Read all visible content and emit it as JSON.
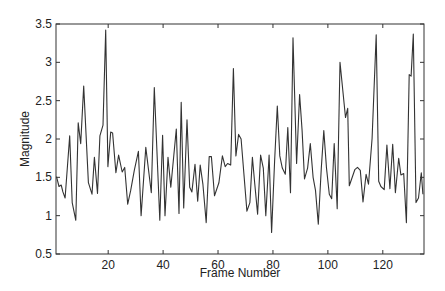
{
  "chart_data": {
    "type": "line",
    "title": "",
    "xlabel": "Frame Number",
    "ylabel": "Magnitude",
    "xlim": [
      1,
      135
    ],
    "ylim": [
      0.5,
      3.5
    ],
    "grid": false,
    "legend": null,
    "xticks": [
      20,
      40,
      60,
      80,
      100,
      120
    ],
    "yticks": [
      0.5,
      1,
      1.5,
      2,
      2.5,
      3,
      3.5
    ],
    "xtick_labels": [
      "20",
      "40",
      "60",
      "80",
      "100",
      "120"
    ],
    "ytick_labels": [
      "0.5",
      "1",
      "1.5",
      "2",
      "2.5",
      "3",
      "3.5"
    ],
    "line_color": "#333333",
    "series": [
      {
        "name": "Magnitude",
        "x": [
          1.2,
          2.1,
          2.9,
          3.5,
          4.3,
          6.0,
          6.9,
          8.2,
          9.1,
          10.0,
          11.1,
          12.8,
          14.1,
          15.0,
          16.1,
          17.0,
          18.1,
          19.1,
          19.9,
          20.9,
          21.6,
          22.8,
          23.8,
          25.1,
          26.0,
          27.1,
          28.2,
          29.5,
          31.0,
          32.0,
          33.7,
          35.7,
          36.8,
          38.8,
          39.8,
          40.7,
          41.8,
          42.8,
          44.8,
          45.8,
          46.6,
          47.5,
          48.7,
          49.7,
          50.5,
          51.6,
          52.6,
          53.5,
          54.5,
          55.7,
          56.8,
          57.6,
          58.7,
          60.3,
          61.6,
          62.6,
          63.5,
          64.6,
          65.6,
          66.5,
          67.5,
          68.4,
          70.5,
          71.6,
          72.5,
          73.4,
          74.4,
          75.5,
          76.5,
          77.4,
          78.6,
          79.5,
          80.6,
          81.6,
          82.5,
          83.4,
          84.5,
          85.4,
          86.4,
          87.3,
          88.6,
          89.7,
          90.6,
          91.5,
          92.6,
          93.6,
          94.6,
          95.5,
          96.5,
          97.6,
          98.5,
          99.5,
          100.5,
          101.4,
          102.3,
          103.4,
          104.4,
          106.4,
          107.2,
          107.8,
          109.8,
          110.8,
          111.8,
          112.8,
          113.9,
          114.8,
          116.1,
          117.6,
          118.5,
          119.3,
          120.5,
          121.5,
          122.6,
          123.6,
          124.6,
          125.8,
          126.6,
          127.6,
          128.6,
          129.6,
          130.3,
          131.1,
          132.1,
          133.0,
          134.0,
          134.6
        ],
        "y": [
          1.51,
          1.38,
          1.4,
          1.31,
          1.23,
          2.04,
          1.17,
          0.94,
          2.21,
          1.94,
          2.69,
          1.43,
          1.28,
          1.76,
          1.29,
          2.04,
          2.18,
          3.42,
          1.64,
          2.09,
          2.08,
          1.56,
          1.79,
          1.57,
          1.63,
          1.15,
          1.33,
          1.59,
          1.84,
          1.0,
          1.89,
          1.3,
          2.67,
          0.94,
          2.05,
          1.0,
          1.76,
          1.37,
          2.13,
          1.03,
          2.48,
          1.1,
          2.25,
          1.37,
          1.31,
          1.67,
          1.19,
          1.66,
          1.41,
          0.91,
          1.77,
          1.77,
          1.26,
          1.43,
          1.78,
          1.64,
          1.68,
          1.66,
          2.92,
          1.78,
          2.06,
          2.0,
          1.06,
          1.17,
          1.76,
          1.41,
          1.02,
          1.79,
          1.62,
          1.0,
          1.79,
          0.78,
          1.71,
          2.43,
          1.78,
          1.62,
          1.54,
          2.15,
          1.3,
          3.32,
          1.68,
          2.58,
          2.11,
          1.48,
          1.62,
          1.94,
          1.5,
          1.33,
          0.89,
          1.62,
          2.11,
          1.62,
          1.28,
          1.22,
          1.94,
          1.09,
          3.0,
          2.28,
          2.4,
          1.39,
          1.6,
          1.63,
          1.59,
          1.18,
          1.54,
          1.41,
          2.01,
          3.36,
          1.45,
          1.38,
          1.34,
          1.92,
          1.35,
          1.93,
          1.3,
          1.75,
          1.53,
          1.55,
          0.91,
          2.84,
          2.82,
          3.37,
          1.17,
          1.23,
          1.56,
          1.28
        ]
      }
    ]
  }
}
